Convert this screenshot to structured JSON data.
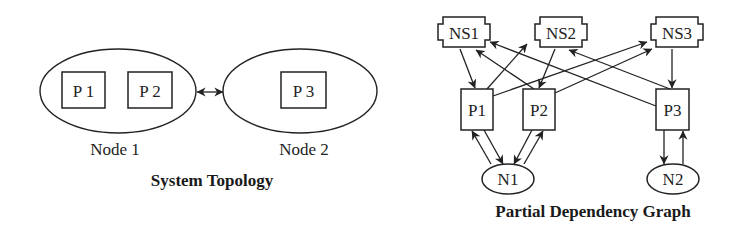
{
  "system_topology": {
    "title": "System Topology",
    "nodes": [
      {
        "label": "Node 1",
        "processes": [
          "P 1",
          "P 2"
        ]
      },
      {
        "label": "Node 2",
        "processes": [
          "P 3"
        ]
      }
    ],
    "link": "Node 1 <-> Node 2"
  },
  "dependency_graph": {
    "title": "Partial Dependency Graph",
    "name_servers": [
      "NS1",
      "NS2",
      "NS3"
    ],
    "processes": [
      "P1",
      "P2",
      "P3"
    ],
    "nodes": [
      "N1",
      "N2"
    ],
    "edges": [
      {
        "from": "NS1",
        "to": "P1"
      },
      {
        "from": "P1",
        "to": "NS2"
      },
      {
        "from": "P1",
        "to": "NS3"
      },
      {
        "from": "NS2",
        "to": "P2"
      },
      {
        "from": "P2",
        "to": "NS1"
      },
      {
        "from": "P2",
        "to": "NS3"
      },
      {
        "from": "NS3",
        "to": "P3"
      },
      {
        "from": "P3",
        "to": "NS1"
      },
      {
        "from": "P3",
        "to": "NS2"
      },
      {
        "from": "P1",
        "to": "N1"
      },
      {
        "from": "N1",
        "to": "P1"
      },
      {
        "from": "P2",
        "to": "N1"
      },
      {
        "from": "N1",
        "to": "P2"
      },
      {
        "from": "P3",
        "to": "N2"
      },
      {
        "from": "N2",
        "to": "P3"
      }
    ]
  }
}
